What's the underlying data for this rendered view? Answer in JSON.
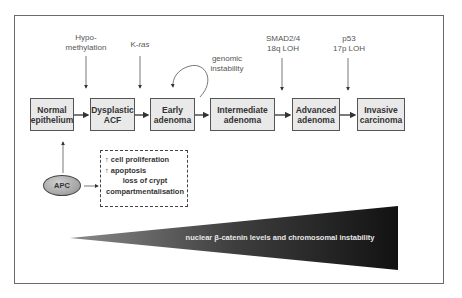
{
  "diagram": {
    "stages": [
      {
        "line1": "Normal",
        "line2": "epithelium"
      },
      {
        "line1": "Dysplastic",
        "line2": "ACF"
      },
      {
        "line1": "Early",
        "line2": "adenoma"
      },
      {
        "line1": "Intermediate",
        "line2": "adenoma"
      },
      {
        "line1": "Advanced",
        "line2": "adenoma"
      },
      {
        "line1": "Invasive",
        "line2": "carcinoma"
      }
    ],
    "events": {
      "hypomethylation": {
        "line1": "Hypo-",
        "line2": "methylation"
      },
      "kras": {
        "prefix": "K-",
        "italic": "ras"
      },
      "genomic": {
        "line1": "genomic",
        "line2": "instability"
      },
      "smad": {
        "line1": "SMAD2/4",
        "line2": "18q LOH"
      },
      "p53": {
        "line1": "p53",
        "line2": "17p LOH"
      }
    },
    "apc": {
      "label": "APC"
    },
    "effects": {
      "up_arrow": "↑",
      "item1": "cell proliferation",
      "item2": "apoptosis",
      "item3": "loss of crypt",
      "item4": "compartmentalisation"
    },
    "wedge": {
      "label": "nuclear β-catenin levels and chromosomal instability"
    },
    "colors": {
      "box_fill": "#e9e9e9",
      "border": "#555555",
      "wedge_dark": "#151515",
      "wedge_light": "#8a8a8a"
    }
  }
}
